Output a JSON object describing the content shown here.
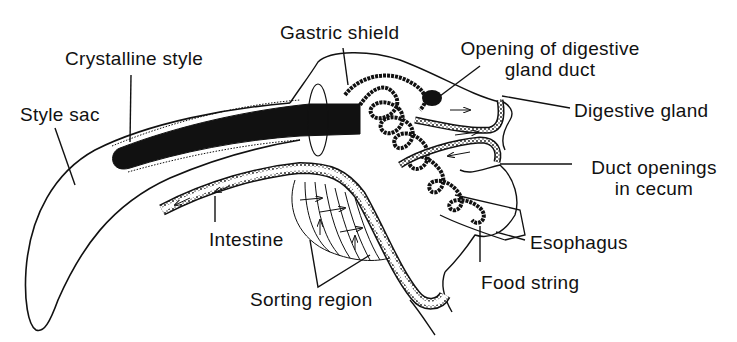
{
  "diagram": {
    "colors": {
      "ink": "#111111",
      "background": "#ffffff"
    },
    "labels": {
      "gastric_shield": "Gastric shield",
      "crystalline_style": "Crystalline style",
      "style_sac": "Style sac",
      "opening_line1": "Opening of digestive",
      "opening_line2": "gland duct",
      "digestive_gland": "Digestive gland",
      "duct_openings_line1": "Duct openings",
      "duct_openings_line2": "in cecum",
      "esophagus": "Esophagus",
      "food_string": "Food string",
      "intestine": "Intestine",
      "sorting_region": "Sorting region"
    }
  }
}
